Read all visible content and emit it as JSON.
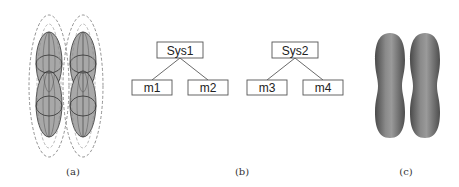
{
  "panels": {
    "a": {
      "caption": "(a)",
      "description": "two groups of overlapping gray ellipsoids enclosed by dashed ellipses"
    },
    "b": {
      "caption": "(b)",
      "trees": [
        {
          "root": "Sys1",
          "children": [
            "m1",
            "m2"
          ]
        },
        {
          "root": "Sys2",
          "children": [
            "m3",
            "m4"
          ]
        }
      ]
    },
    "c": {
      "caption": "(c)",
      "description": "two gray shaded capsule-shaped surfaces"
    }
  },
  "colors": {
    "ellipse_fill": "#a8a8a8",
    "capsule_fill": "#6e6e6e",
    "box_stroke": "#555555",
    "dashed_stroke": "#777777"
  }
}
